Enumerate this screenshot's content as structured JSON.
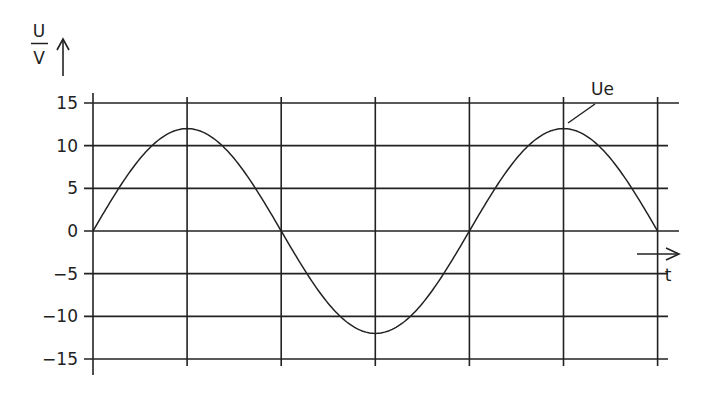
{
  "chart_data": {
    "type": "line",
    "title": "",
    "xlabel": "t",
    "ylabel": "U / V",
    "ylabel_numerator": "U",
    "ylabel_denominator": "V",
    "ylim": [
      -15,
      15
    ],
    "yticks": [
      15,
      10,
      5,
      0,
      -5,
      -10,
      -15
    ],
    "ytick_labels": [
      "15",
      "10",
      "5",
      "0",
      "−5",
      "−10",
      "−15"
    ],
    "x_gridlines": 7,
    "grid": true,
    "series": [
      {
        "name": "Ue",
        "label": "Ue",
        "function": "sine",
        "amplitude": 12,
        "periods": 1.5,
        "x": [
          0,
          1,
          2,
          3,
          4,
          5,
          6
        ],
        "values": [
          0,
          12,
          0,
          -12,
          0,
          12,
          0
        ]
      }
    ],
    "legend": {
      "position": "annotation",
      "text": "Ue"
    },
    "colors": {
      "line": "#222222",
      "background": "#ffffff"
    }
  }
}
